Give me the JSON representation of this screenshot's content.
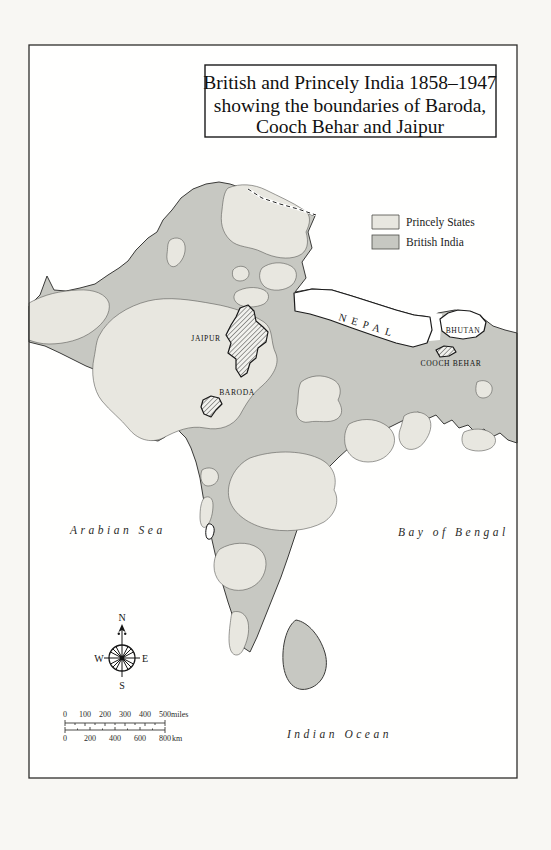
{
  "title": {
    "line1": "British and Princely India 1858–1947",
    "line2": "showing the boundaries of Baroda,",
    "line3": "Cooch Behar and Jaipur"
  },
  "legend": {
    "princely": {
      "label": "Princely States",
      "color": "#e8e7e0"
    },
    "british": {
      "label": "British India",
      "color": "#c7c8c2"
    }
  },
  "regions": {
    "nepal": "NEPAL",
    "bhutan": "BHUTAN",
    "cooch_behar": "COOCH BEHAR",
    "jaipur": "JAIPUR",
    "baroda": "BARODA"
  },
  "seas": {
    "arabian": "Arabian Sea",
    "bengal": "Bay of Bengal",
    "indian": "Indian Ocean"
  },
  "compass": {
    "n": "N",
    "e": "E",
    "s": "S",
    "w": "W"
  },
  "scale": {
    "miles": {
      "ticks": [
        "0",
        "100",
        "200",
        "300",
        "400",
        "500"
      ],
      "unit": "miles"
    },
    "km": {
      "ticks": [
        "0",
        "200",
        "400",
        "600",
        "800"
      ],
      "unit": "km"
    }
  },
  "colors": {
    "princely_states": "#e8e7e0",
    "british_india": "#c7c8c2"
  }
}
